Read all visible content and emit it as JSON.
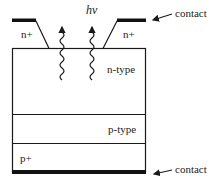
{
  "diagram": {
    "type": "semiconductor-photodiode-cross-section",
    "layers": [
      {
        "name": "n+",
        "label": "n+",
        "position": "top-left"
      },
      {
        "name": "n+",
        "label": "n+",
        "position": "top-right"
      },
      {
        "name": "n-type",
        "label": "n-type"
      },
      {
        "name": "p-type",
        "label": "p-type"
      },
      {
        "name": "p+",
        "label": "p+"
      }
    ],
    "labels": {
      "photon": "hν",
      "top_contact": "contact",
      "bottom_contact": "contact",
      "n_plus_left": "n+",
      "n_plus_right": "n+",
      "n_type": "n-type",
      "p_type": "p-type",
      "p_plus": "p+"
    },
    "colors": {
      "line": "#1a1a1a",
      "contact": "#111111",
      "background": "#ffffff"
    }
  }
}
